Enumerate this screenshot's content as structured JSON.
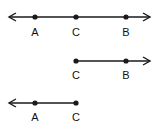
{
  "diagram": {
    "color": "#1a1a1a",
    "rows": [
      {
        "name": "line-AB",
        "type": "line",
        "y": 17,
        "x_start": 9,
        "x_end": 150,
        "arrow_left": true,
        "arrow_right": true,
        "label_y": 27,
        "points": [
          {
            "label": "A",
            "x": 35
          },
          {
            "label": "C",
            "x": 76
          },
          {
            "label": "B",
            "x": 126
          }
        ]
      },
      {
        "name": "ray-CB",
        "type": "ray",
        "y": 61,
        "x_start": 76,
        "x_end": 150,
        "arrow_left": false,
        "arrow_right": true,
        "label_y": 70,
        "points": [
          {
            "label": "C",
            "x": 76
          },
          {
            "label": "B",
            "x": 126
          }
        ]
      },
      {
        "name": "ray-CA",
        "type": "ray",
        "y": 103,
        "x_start": 9,
        "x_end": 76,
        "arrow_left": true,
        "arrow_right": false,
        "label_y": 112,
        "points": [
          {
            "label": "A",
            "x": 35
          },
          {
            "label": "C",
            "x": 76
          }
        ]
      }
    ]
  }
}
